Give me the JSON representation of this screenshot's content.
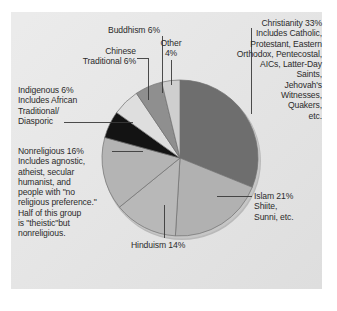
{
  "figure": {
    "background": "#ffffff",
    "panel_color": "#e6e6e6"
  },
  "chart_data": {
    "type": "pie",
    "title": "",
    "xlabel": "",
    "ylabel": "",
    "legend_position": "none",
    "grid": false,
    "start_angle_deg": 90,
    "direction": "clockwise",
    "units": "percent",
    "categories": [
      "Christianity",
      "Islam",
      "Hinduism",
      "Nonreligious",
      "Indigenous",
      "Chinese Traditional",
      "Buddhism",
      "Other"
    ],
    "values": [
      33,
      21,
      14,
      16,
      6,
      6,
      6,
      4
    ],
    "colors": [
      "#6e6e6e",
      "#b1b1b1",
      "#b8b8b8",
      "#b4b4b4",
      "#131313",
      "#dedede",
      "#8f8f8f",
      "#cfcfcf"
    ],
    "slices": [
      {
        "label": "Christianity",
        "value": 33,
        "color": "#6e6e6e"
      },
      {
        "label": "Islam",
        "value": 21,
        "color": "#b1b1b1"
      },
      {
        "label": "Hinduism",
        "value": 14,
        "color": "#b8b8b8"
      },
      {
        "label": "Nonreligious",
        "value": 16,
        "color": "#b4b4b4"
      },
      {
        "label": "Indigenous",
        "value": 6,
        "color": "#131313"
      },
      {
        "label": "Chinese Traditional",
        "value": 6,
        "color": "#dedede"
      },
      {
        "label": "Buddhism",
        "value": 6,
        "color": "#8f8f8f"
      },
      {
        "label": "Other",
        "value": 4,
        "color": "#cfcfcf"
      }
    ]
  },
  "labels": {
    "christianity": "Christianity 33%\nIncludes Catholic,\nProtestant, Eastern\nOrthodox, Pentecostal,\nAICs, Latter-Day\nSaints,\nJehovah's\nWitnesses,\nQuakers,\netc.",
    "islam": "Islam 21%\nShiite,\nSunni, etc.",
    "hinduism": "Hinduism 14%",
    "nonreligious": "Nonreligious 16%\nIncludes agnostic,\natheist, secular\nhumanist, and\npeople with \"no\nreligious preference.\"\nHalf of this group\nis \"theistic\"but\nnonreligious.",
    "indigenous": "Indigenous 6%\nIncludes African\nTraditional/\nDiasporic",
    "chinese_traditional": "Chinese\nTraditional 6%",
    "buddhism": "Buddhism 6%",
    "other": "Other\n4%"
  }
}
